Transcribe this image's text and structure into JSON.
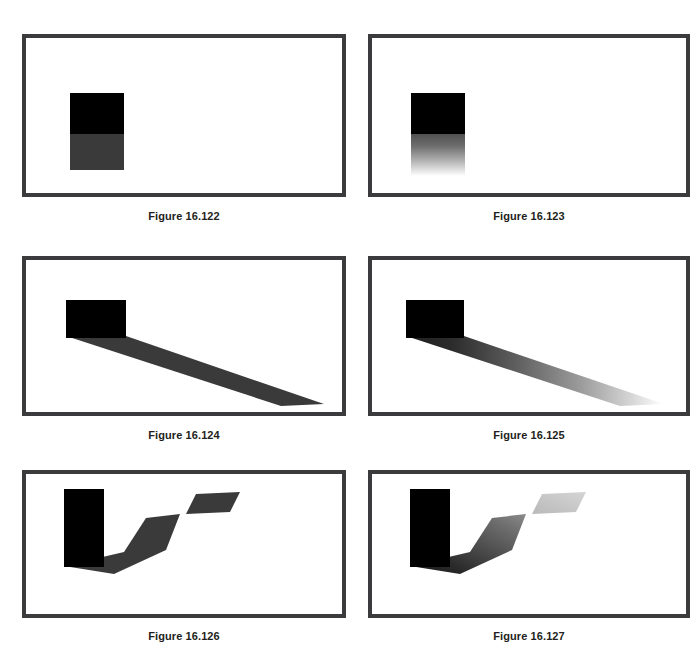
{
  "page": {
    "background_color": "#ffffff",
    "width": 697,
    "height": 646
  },
  "style": {
    "frame_border_color": "#3b3b3d",
    "frame_fill_color": "#ffffff",
    "occluder_color": "#000000",
    "hard_shadow_color": "#3a3a3a",
    "caption_color": "#231f20"
  },
  "figures": [
    {
      "id": "fig-16-122",
      "caption": "Figure 16.122",
      "shadow_type": "hard-edged",
      "description": "Black rectangle with a uniform dark-gray hard-edged shadow directly below it"
    },
    {
      "id": "fig-16-123",
      "caption": "Figure 16.123",
      "shadow_type": "soft-gradient",
      "description": "Black rectangle with a vertical shadow that fades from dark to white"
    },
    {
      "id": "fig-16-124",
      "caption": "Figure 16.124",
      "shadow_type": "hard-edged",
      "description": "Black square casting a long uniform wedge shadow to the lower right"
    },
    {
      "id": "fig-16-125",
      "caption": "Figure 16.125",
      "shadow_type": "soft-gradient",
      "description": "Black square casting a long wedge shadow that fades toward the tip"
    },
    {
      "id": "fig-16-126",
      "caption": "Figure 16.126",
      "shadow_type": "hard-edged",
      "description": "Tall black rectangle with a bent uniform shadow plus a detached parallelogram patch"
    },
    {
      "id": "fig-16-127",
      "caption": "Figure 16.127",
      "shadow_type": "soft-gradient",
      "description": "Tall black rectangle with a bent shadow fading with distance plus a faint detached patch"
    }
  ]
}
